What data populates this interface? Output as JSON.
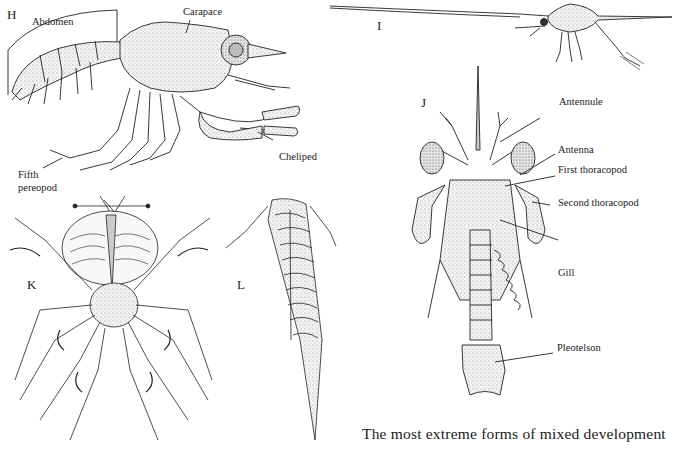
{
  "figure": {
    "panels": [
      {
        "id": "H",
        "letter": "H",
        "labels": [
          "Abdomen",
          "Carapace",
          "Cheliped",
          "Fifth",
          "pereopod"
        ]
      },
      {
        "id": "I",
        "letter": "I",
        "labels": []
      },
      {
        "id": "J",
        "letter": "J",
        "labels": [
          "Antennule",
          "Antenna",
          "First thoracopod",
          "Second thoracopod",
          "Gill",
          "Pleotelson"
        ]
      },
      {
        "id": "K",
        "letter": "K",
        "labels": []
      },
      {
        "id": "L",
        "letter": "L",
        "labels": []
      }
    ],
    "labels": {
      "abdomen": "Abdomen",
      "carapace": "Carapace",
      "cheliped": "Cheliped",
      "fifth_pereopod_line1": "Fifth",
      "fifth_pereopod_line2": "pereopod",
      "antennule": "Antennule",
      "antenna": "Antenna",
      "first_thoracopod": "First thoracopod",
      "second_thoracopod": "Second thoracopod",
      "gill": "Gill",
      "pleotelson": "Pleotelson"
    },
    "caption": "The most extreme forms of mixed development",
    "colors": {
      "ink": "#1a1a1a",
      "stipple": "#d8d8d8",
      "background": "#ffffff"
    }
  }
}
